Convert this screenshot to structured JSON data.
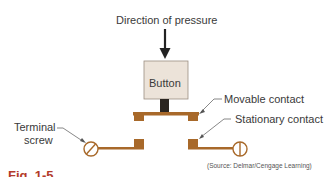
{
  "diagram": {
    "title": "Direction of pressure",
    "button_label": "Button",
    "labels": {
      "movable_contact": "Movable contact",
      "stationary_contact": "Stationary contact",
      "terminal_screw_line1": "Terminal",
      "terminal_screw_line2": "screw"
    },
    "source": "(Source: Delmar/Cengage Learning)",
    "caption_fragment": "Fig. 1-5"
  },
  "colors": {
    "contact": "#a8692a",
    "button_fill": "#ece3d9",
    "plunger": "#2b2520",
    "text": "#3a3a3a",
    "caption": "#b33a2a"
  }
}
